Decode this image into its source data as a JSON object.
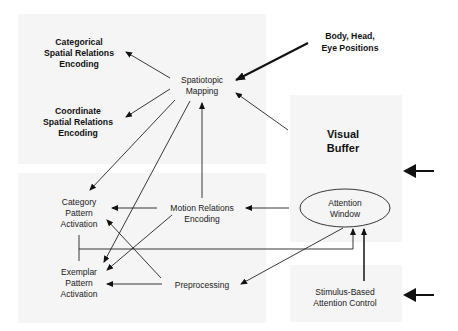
{
  "diagram": {
    "nodes": {
      "categorical": {
        "lines": [
          "Categorical",
          "Spatial Relations",
          "Encoding"
        ]
      },
      "coordinate": {
        "lines": [
          "Coordinate",
          "Spatial Relations",
          "Encoding"
        ]
      },
      "spatiotopic": {
        "lines": [
          "Spatiotopic",
          "Mapping"
        ]
      },
      "body": {
        "lines": [
          "Body, Head,",
          "Eye Positions"
        ]
      },
      "visual_buffer": {
        "lines": [
          "Visual",
          "Buffer"
        ]
      },
      "category_pattern": {
        "lines": [
          "Category",
          "Pattern",
          "Activation"
        ]
      },
      "motion": {
        "lines": [
          "Motion Relations",
          "Encoding"
        ]
      },
      "attention_window": {
        "lines": [
          "Attention",
          "Window"
        ]
      },
      "exemplar_pattern": {
        "lines": [
          "Exemplar",
          "Pattern",
          "Activation"
        ]
      },
      "preprocessing": {
        "lines": [
          "Preprocessing"
        ]
      },
      "stimulus": {
        "lines": [
          "Stimulus-Based",
          "Attention Control"
        ]
      }
    },
    "edges": [
      {
        "from": "Spatiotopic Mapping",
        "to": "Categorical Spatial Relations Encoding"
      },
      {
        "from": "Spatiotopic Mapping",
        "to": "Coordinate Spatial Relations Encoding"
      },
      {
        "from": "Spatiotopic Mapping",
        "to": "Category Pattern Activation"
      },
      {
        "from": "Spatiotopic Mapping",
        "to": "Exemplar Pattern Activation"
      },
      {
        "from": "Body, Head, Eye Positions",
        "to": "Spatiotopic Mapping"
      },
      {
        "from": "Visual Buffer",
        "to": "Spatiotopic Mapping"
      },
      {
        "from": "Motion Relations Encoding",
        "to": "Spatiotopic Mapping"
      },
      {
        "from": "Motion Relations Encoding",
        "to": "Category Pattern Activation"
      },
      {
        "from": "Motion Relations Encoding",
        "to": "Exemplar Pattern Activation"
      },
      {
        "from": "Attention Window",
        "to": "Motion Relations Encoding"
      },
      {
        "from": "Attention Window",
        "to": "Preprocessing"
      },
      {
        "from": "Preprocessing",
        "to": "Category Pattern Activation"
      },
      {
        "from": "Preprocessing",
        "to": "Exemplar Pattern Activation"
      },
      {
        "from": "Pattern Activation",
        "to": "Attention Window"
      },
      {
        "from": "Stimulus-Based Attention Control",
        "to": "Attention Window"
      }
    ]
  }
}
